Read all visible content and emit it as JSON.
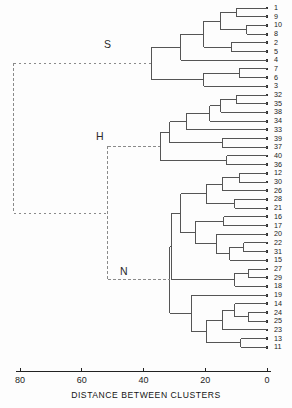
{
  "chart_data": {
    "type": "dendrogram",
    "title": "",
    "xlabel": "DISTANCE BETWEEN CLUSTERS",
    "ylabel": "",
    "xlim": [
      80,
      0
    ],
    "x_ticks": [
      80,
      60,
      40,
      20,
      0
    ],
    "x_tick_labels": [
      "80",
      "60",
      "40",
      "20",
      "0"
    ],
    "grid": false,
    "orientation": "horizontal-right-to-left",
    "leaf_labels": [
      "1",
      "9",
      "10",
      "8",
      "2",
      "5",
      "4",
      "7",
      "6",
      "3",
      "32",
      "35",
      "38",
      "34",
      "33",
      "39",
      "37",
      "40",
      "36",
      "12",
      "30",
      "26",
      "28",
      "21",
      "16",
      "17",
      "20",
      "22",
      "31",
      "15",
      "27",
      "29",
      "18",
      "19",
      "14",
      "24",
      "25",
      "23",
      "13",
      "11"
    ],
    "cluster_annotations": [
      {
        "name": "S",
        "label": "S",
        "members": [
          "1",
          "9",
          "10",
          "8",
          "2",
          "5",
          "4",
          "7",
          "6",
          "3"
        ],
        "merge_distance": 37.5
      },
      {
        "name": "H",
        "label": "H",
        "members": [
          "32",
          "35",
          "38",
          "34",
          "33",
          "39",
          "37",
          "40",
          "36"
        ],
        "merge_distance": 31.5
      },
      {
        "name": "N",
        "label": "N",
        "members": [
          "12",
          "30",
          "26",
          "28",
          "21",
          "16",
          "17",
          "20",
          "22",
          "31",
          "15",
          "27",
          "29",
          "18",
          "19",
          "14",
          "24",
          "25",
          "23",
          "13",
          "11"
        ],
        "merge_distance": 31.5
      }
    ],
    "root_distance": 82,
    "second_node_distance": 51.5,
    "merges": [
      {
        "id": "m1",
        "left": "1",
        "right": "9",
        "distance": 10.0
      },
      {
        "id": "m2",
        "left": "10",
        "right": "8",
        "distance": 6.5
      },
      {
        "id": "m3",
        "left": "m1",
        "right": "m2",
        "distance": 15.0
      },
      {
        "id": "m4",
        "left": "2",
        "right": "5",
        "distance": 11.5
      },
      {
        "id": "m5",
        "left": "m3",
        "right": "m4",
        "distance": 20.5
      },
      {
        "id": "m6",
        "left": "m5",
        "right": "4",
        "distance": 28.0
      },
      {
        "id": "m7",
        "left": "7",
        "right": "6",
        "distance": 9.0
      },
      {
        "id": "m8",
        "left": "m7",
        "right": "3",
        "distance": 20.5
      },
      {
        "id": "m9",
        "left": "m6",
        "right": "m8",
        "distance": 37.5
      },
      {
        "id": "m10",
        "left": "32",
        "right": "35",
        "distance": 10.0
      },
      {
        "id": "m11",
        "left": "m10",
        "right": "38",
        "distance": 15.0
      },
      {
        "id": "m12",
        "left": "m11",
        "right": "34",
        "distance": 18.5
      },
      {
        "id": "m13",
        "left": "m12",
        "right": "33",
        "distance": 26.0
      },
      {
        "id": "m14",
        "left": "39",
        "right": "37",
        "distance": 14.5
      },
      {
        "id": "m15",
        "left": "m13",
        "right": "m14",
        "distance": 31.5
      },
      {
        "id": "m16",
        "left": "40",
        "right": "36",
        "distance": 13.0
      },
      {
        "id": "m17",
        "left": "m15",
        "right": "m16",
        "distance": 34.5
      },
      {
        "id": "m18",
        "left": "12",
        "right": "30",
        "distance": 9.0
      },
      {
        "id": "m19",
        "left": "m18",
        "right": "26",
        "distance": 14.5
      },
      {
        "id": "m20",
        "left": "28",
        "right": "21",
        "distance": 10.5
      },
      {
        "id": "m21",
        "left": "m19",
        "right": "m20",
        "distance": 19.5
      },
      {
        "id": "m22",
        "left": "16",
        "right": "17",
        "distance": 14.0
      },
      {
        "id": "m23",
        "left": "22",
        "right": "31",
        "distance": 7.5
      },
      {
        "id": "m24",
        "left": "m23",
        "right": "15",
        "distance": 12.0
      },
      {
        "id": "m25",
        "left": "20",
        "right": "m24",
        "distance": 16.5
      },
      {
        "id": "m26",
        "left": "m22",
        "right": "m25",
        "distance": 23.0
      },
      {
        "id": "m27",
        "left": "m21",
        "right": "m26",
        "distance": 28.0
      },
      {
        "id": "m28",
        "left": "27",
        "right": "29",
        "distance": 6.0
      },
      {
        "id": "m29",
        "left": "m28",
        "right": "18",
        "distance": 10.5
      },
      {
        "id": "m30",
        "left": "m27",
        "right": "m29",
        "distance": 31.0
      },
      {
        "id": "m31",
        "left": "24",
        "right": "25",
        "distance": 6.0
      },
      {
        "id": "m32",
        "left": "14",
        "right": "m31",
        "distance": 10.5
      },
      {
        "id": "m33",
        "left": "m32",
        "right": "23",
        "distance": 14.5
      },
      {
        "id": "m34",
        "left": "13",
        "right": "11",
        "distance": 8.5
      },
      {
        "id": "m35",
        "left": "m33",
        "right": "m34",
        "distance": 19.5
      },
      {
        "id": "m36",
        "left": "19",
        "right": "m35",
        "distance": 24.5
      },
      {
        "id": "m37",
        "left": "m30",
        "right": "m36",
        "distance": 31.5
      },
      {
        "id": "m38",
        "left": "m17",
        "right": "m37",
        "distance": 51.5
      },
      {
        "id": "m39",
        "left": "m9",
        "right": "m38",
        "distance": 82.0
      }
    ]
  },
  "axis": {
    "title": "DISTANCE BETWEEN CLUSTERS",
    "ticks": [
      "80",
      "60",
      "40",
      "20",
      "0"
    ]
  },
  "clusters": {
    "s": "S",
    "h": "H",
    "n": "N"
  },
  "colors": {
    "line": "#555555",
    "dashed": "#8a8a8a",
    "axis": "#222222",
    "text": "#1a1a1a",
    "background": "#fdfdfd"
  }
}
